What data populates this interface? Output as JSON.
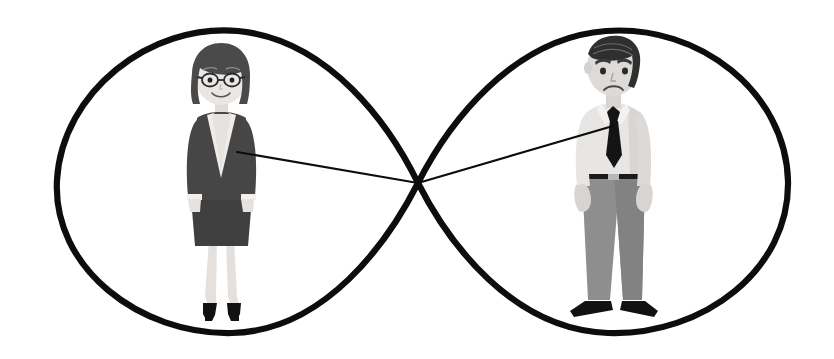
{
  "canvas": {
    "width": 834,
    "height": 359,
    "background": "#ffffff",
    "title": "Infinity loop with businesswoman and businessman connected by a line"
  },
  "palette": {
    "stroke_black": "#0d0d0d",
    "ink_dark": "#3b3b3b",
    "hair_dark": "#4a4a4a",
    "hair_darker": "#2f2f2f",
    "skin_light": "#ededed",
    "skin_shadow": "#d9d9d9",
    "suit_dark": "#464646",
    "skirt_dark": "#3f3f3f",
    "shirt_light": "#e6e6e6",
    "shirt_shadow": "#cfcfcf",
    "trousers_gray": "#8e8e8e",
    "trousers_shadow": "#7c7c7c",
    "tie_black": "#141414",
    "shoe_black": "#111111",
    "white": "#ffffff"
  },
  "infinity": {
    "name": "infinity-symbol",
    "stroke_width": 6,
    "stroke_color": "#0d0d0d",
    "crossing_point": {
      "x": 418,
      "y": 183
    },
    "left_loop": {
      "center_x": 225,
      "center_y": 182,
      "rx": 168,
      "ry": 152
    },
    "right_loop": {
      "center_x": 612,
      "center_y": 182,
      "rx": 176,
      "ry": 152
    },
    "left_extent_x": 57,
    "right_extent_x": 788,
    "top_extent_y": 29,
    "bottom_extent_y": 334
  },
  "connector": {
    "name": "connection-line",
    "stroke_width": 2,
    "stroke_color": "#0d0d0d",
    "from_woman": {
      "x": 237,
      "y": 152
    },
    "to_man": {
      "x": 613,
      "y": 126
    },
    "via": {
      "x": 418,
      "y": 183
    }
  },
  "figures": [
    {
      "id": "businesswoman",
      "name": "businesswoman-figure",
      "label": "Businesswoman",
      "center_x": 221,
      "top_y": 40,
      "bottom_y": 322,
      "expression": "smiling",
      "hair": "dark bob",
      "accessories": [
        "glasses"
      ],
      "outfit": "dark skirt suit with white cuffs",
      "footwear": "black high heels"
    },
    {
      "id": "businessman",
      "name": "businessman-figure",
      "label": "Businessman",
      "center_x": 613,
      "top_y": 38,
      "bottom_y": 320,
      "expression": "frowning",
      "hair": "dark swept-back",
      "accessories": [
        "necktie",
        "belt"
      ],
      "outfit": "light dress shirt with dark tie and gray trousers",
      "footwear": "black dress shoes"
    }
  ]
}
